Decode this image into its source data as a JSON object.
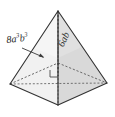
{
  "figure": {
    "kind": "square-based-pyramid-diagram",
    "background_color": "#ffffff",
    "line_color": "#3a3a3a",
    "face_fill_left": "#e9e9e9",
    "face_fill_right": "#d7d7d7",
    "face_fill_front_left": "#f0f0f0",
    "face_fill_front_right": "#dedede",
    "labels": {
      "slant_edge": {
        "text": "8a³b³",
        "coefficient": "8",
        "base_a": "a",
        "exp_a": "3",
        "base_b": "b",
        "exp_b": "3",
        "pointer": "arrow-to-left-slant-edge"
      },
      "height": {
        "text": "6ab",
        "coefficient": "6",
        "base_a": "a",
        "base_b": "b",
        "pointer": "along-vertical-height-line"
      }
    },
    "markers": {
      "right_angle": "square marker at base center where height meets base"
    },
    "vertices": {
      "apex": "58,11",
      "front": "58,105",
      "left": "10,84",
      "right": "107,83",
      "back_hidden": "58,63",
      "base_center": "58,74"
    }
  }
}
